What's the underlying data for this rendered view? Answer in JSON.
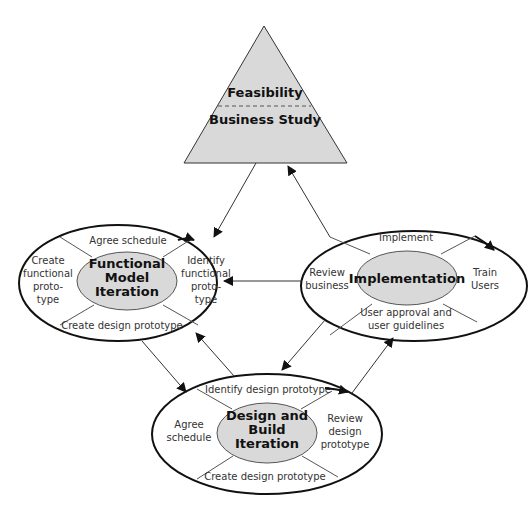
{
  "colors": {
    "stroke": "#111111",
    "fill_gray": "#d9d9d9",
    "text": "#333333"
  },
  "feasibility": {
    "top_label": "Feasibility",
    "bottom_label": "Business Study"
  },
  "functional": {
    "title": [
      "Functional",
      "Model",
      "Iteration"
    ],
    "top": "Agree schedule",
    "left": [
      "Create",
      "functional",
      "proto-",
      "type"
    ],
    "right": [
      "Identify",
      "functional",
      "proto-",
      "type"
    ],
    "bottom": "Create design prototype"
  },
  "implementation": {
    "title": "Implementation",
    "top": "Implement",
    "left": [
      "Review",
      "business"
    ],
    "right": [
      "Train",
      "Users"
    ],
    "bottom": [
      "User approval and",
      "user guidelines"
    ]
  },
  "design": {
    "title": [
      "Design and",
      "Build",
      "Iteration"
    ],
    "top": "Identify design prototype",
    "left": [
      "Agree",
      "schedule"
    ],
    "right": [
      "Review",
      "design",
      "prototype"
    ],
    "bottom": "Create design prototype"
  }
}
